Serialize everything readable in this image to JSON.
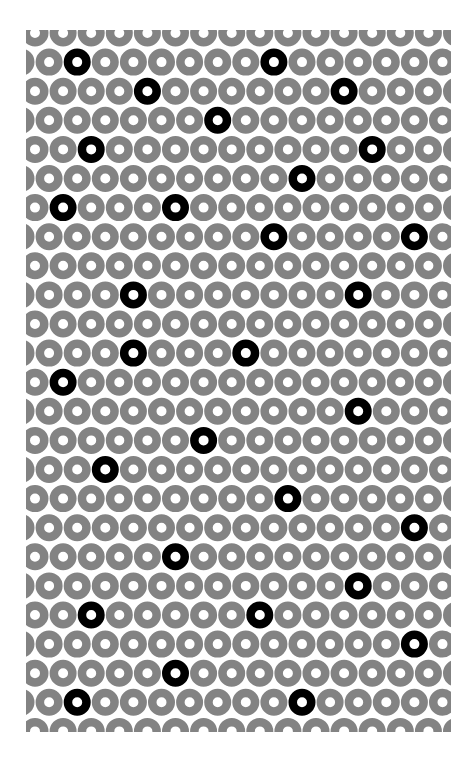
{
  "pattern": {
    "title": "",
    "background_color": "#ffffff",
    "ring_color": "#838383",
    "highlight_color": "#000000",
    "panel": {
      "x": 26,
      "y": 30,
      "width": 425,
      "height": 702
    },
    "grid": {
      "rows": 25,
      "cols": 16,
      "row_spacing": 29.1,
      "col_spacing": 28.1,
      "first_row_center_y": 33,
      "even_row_first_center_x": 35,
      "odd_row_first_center_x": 21,
      "ring_outer_radius": 13.5,
      "ring_inner_radius": 5
    },
    "highlighted_rings": [
      {
        "row": 1,
        "col": 2
      },
      {
        "row": 1,
        "col": 9
      },
      {
        "row": 2,
        "col": 4
      },
      {
        "row": 2,
        "col": 11
      },
      {
        "row": 3,
        "col": 7
      },
      {
        "row": 4,
        "col": 2
      },
      {
        "row": 4,
        "col": 12
      },
      {
        "row": 5,
        "col": 10
      },
      {
        "row": 6,
        "col": 1
      },
      {
        "row": 6,
        "col": 5
      },
      {
        "row": 7,
        "col": 9
      },
      {
        "row": 7,
        "col": 14
      },
      {
        "row": 9,
        "col": 4
      },
      {
        "row": 9,
        "col": 12
      },
      {
        "row": 11,
        "col": 4
      },
      {
        "row": 11,
        "col": 8
      },
      {
        "row": 12,
        "col": 1
      },
      {
        "row": 13,
        "col": 12
      },
      {
        "row": 14,
        "col": 6
      },
      {
        "row": 15,
        "col": 3
      },
      {
        "row": 16,
        "col": 9
      },
      {
        "row": 17,
        "col": 14
      },
      {
        "row": 18,
        "col": 5
      },
      {
        "row": 19,
        "col": 12
      },
      {
        "row": 20,
        "col": 2
      },
      {
        "row": 20,
        "col": 8
      },
      {
        "row": 21,
        "col": 14
      },
      {
        "row": 22,
        "col": 5
      },
      {
        "row": 23,
        "col": 2
      },
      {
        "row": 23,
        "col": 10
      }
    ],
    "highlighted_count": 30
  }
}
